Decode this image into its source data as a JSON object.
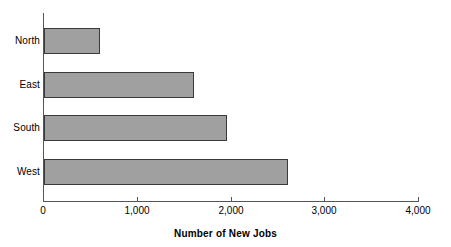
{
  "chart_data": {
    "type": "bar",
    "orientation": "horizontal",
    "title": "",
    "xlabel": "Number of New Jobs",
    "ylabel": "",
    "categories": [
      "North",
      "East",
      "South",
      "West"
    ],
    "values": [
      600,
      1600,
      1950,
      2600
    ],
    "series": [
      {
        "name": "Number of New Jobs",
        "values": [
          600,
          1600,
          1950,
          2600
        ]
      }
    ],
    "xlim": [
      0,
      4000
    ],
    "xticks": [
      0,
      1000,
      2000,
      3000,
      4000
    ],
    "xtick_labels": [
      "0",
      "1,000",
      "2,000",
      "3,000",
      "4,000"
    ],
    "grid": false,
    "legend": false,
    "bar_fill_color": "#a0a0a0",
    "bar_border_color": "#3a3a3a",
    "axis_color": "#555555"
  },
  "axis": {
    "x_title": "Number of New Jobs"
  }
}
